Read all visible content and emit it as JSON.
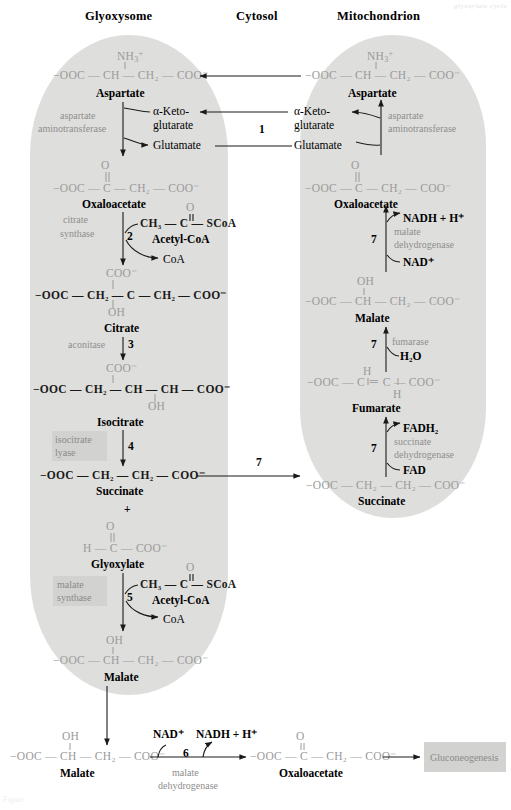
{
  "figure": {
    "title_watermark": "glyoxylate cycle",
    "bottom_watermark": "Figure"
  },
  "compartments": {
    "left": "Glyoxysome",
    "middle": "Cytosol",
    "right": "Mitochondrion"
  },
  "glyoxysome": {
    "aspartate": {
      "amine": "NH",
      "amine_sub": "3",
      "amine_sup": "+",
      "formula_pre": "−OOC",
      "formula": "−OOC — CH — CH₂ — COO⁻",
      "label": "Aspartate"
    },
    "aspartate_aminotransferase": "aspartate\naminotransferase",
    "aspartate_aminotransferase_l1": "aspartate",
    "aspartate_aminotransferase_l2": "aminotransferase",
    "alpha_ketoglutarate_l1": "α-Keto-",
    "alpha_ketoglutarate_l2": "glutarate",
    "glutamate": "Glutamate",
    "oxaloacetate": {
      "carbonyl_o": "O",
      "formula": "−OOC — C — CH₂ — COO⁻",
      "label": "Oxaloacetate"
    },
    "citrate_synthase_l1": "citrate",
    "citrate_synthase_l2": "synthase",
    "step_2": "2",
    "acetyl_coa_o": "O",
    "acetyl_coa_formula": "CH₃ — C — SCoA",
    "acetyl_coa_label": "Acetyl-CoA",
    "coa": "CoA",
    "citrate": {
      "top": "COO⁻",
      "formula": "−OOC — CH₂ — C — CH₂ — COO⁻",
      "bottom": "OH",
      "label": "Citrate"
    },
    "aconitase": "aconitase",
    "step_3": "3",
    "isocitrate": {
      "top": "COO⁻",
      "formula": "−OOC — CH₂ — CH — CH — COO⁻",
      "bottom": "OH",
      "label": "Isocitrate"
    },
    "isocitrate_lyase_l1": "isocitrate",
    "isocitrate_lyase_l2": "lyase",
    "step_4": "4",
    "succinate": {
      "formula": "−OOC — CH₂ — CH₂ — COO⁻",
      "label": "Succinate"
    },
    "plus": "+",
    "glyoxylate": {
      "carbonyl_o": "O",
      "formula": "H — C — COO⁻",
      "label": "Glyoxylate"
    },
    "malate_synthase_l1": "malate",
    "malate_synthase_l2": "synthase",
    "step_5": "5",
    "acetyl_coa2_o": "O",
    "acetyl_coa2_formula": "CH₃ — C — SCoA",
    "acetyl_coa2_label": "Acetyl-CoA",
    "coa2": "CoA",
    "malate": {
      "top": "OH",
      "formula": "−OOC — CH — CH₂ — COO⁻",
      "label": "Malate"
    }
  },
  "cytosol": {
    "step_1": "1",
    "step_7": "7",
    "alpha_ketoglutarate_l1": "α-Keto-",
    "alpha_ketoglutarate_l2": "glutarate",
    "glutamate": "Glutamate"
  },
  "mitochondrion": {
    "aspartate": {
      "amine": "NH",
      "amine_sub": "3",
      "amine_sup": "+",
      "formula": "−OOC — CH — CH₂ — COO⁻",
      "label": "Aspartate"
    },
    "aspartate_aminotransferase_l1": "aspartate",
    "aspartate_aminotransferase_l2": "aminotransferase",
    "oxaloacetate": {
      "carbonyl_o": "O",
      "formula": "−OOC — C — CH₂ — COO⁻",
      "label": "Oxaloacetate"
    },
    "step_7a": "7",
    "malate_dehydrogenase_l1": "malate",
    "malate_dehydrogenase_l2": "dehydrogenase",
    "nadh": "NADH + H⁺",
    "nad": "NAD⁺",
    "malate": {
      "top": "OH",
      "formula": "−OOC — CH — CH₂ — COO⁻",
      "label": "Malate"
    },
    "step_7b": "7",
    "fumarase": "fumarase",
    "water": "H₂O",
    "fumarate": {
      "top_h": "H",
      "formula": "−OOC — C ＝ C — COO⁻",
      "bottom_h": "H",
      "label": "Fumarate"
    },
    "step_7c": "7",
    "succinate_dehydrogenase_l1": "succinate",
    "succinate_dehydrogenase_l2": "dehydrogenase",
    "fadh2": "FADH₂",
    "fad": "FAD",
    "succinate": {
      "formula": "−OOC — CH₂ — CH₂ — COO⁻",
      "label": "Succinate"
    }
  },
  "bottom": {
    "malate": {
      "top": "OH",
      "formula": "−OOC — CH — CH₂ — COO⁻",
      "label": "Malate"
    },
    "nad": "NAD⁺",
    "nadh": "NADH + H⁺",
    "step_6": "6",
    "malate_dehydrogenase_l1": "malate",
    "malate_dehydrogenase_l2": "dehydrogenase",
    "oxaloacetate": {
      "carbonyl_o": "O",
      "formula": "−OOC — C — CH₂ — COO⁻",
      "label": "Oxaloacetate"
    },
    "gluconeogenesis": "Gluconeogenesis"
  },
  "colors": {
    "organelle_fill": "#dededc",
    "structure_gray": "#9a9a9a",
    "enzyme_gray": "#8e8e8e",
    "box_fill": "#d2d2d0",
    "stroke": "#1a1a1a"
  }
}
